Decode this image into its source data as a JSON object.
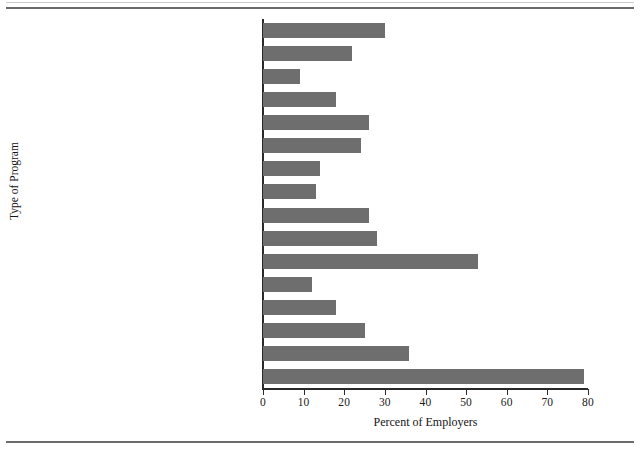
{
  "chart_data": {
    "type": "bar",
    "orientation": "horizontal",
    "title": "",
    "xlabel": "Percent of Employers",
    "ylabel": "Type of Program",
    "xlim": [
      0,
      80
    ],
    "xticks": [
      0,
      10,
      20,
      30,
      40,
      50,
      60,
      70,
      80
    ],
    "grid": false,
    "legend": null,
    "bar_color": "#6e6e6e",
    "axis_color": "#2a2a2a",
    "categories": [
      "Blood Pressure Screenings",
      "Cholesterol Screenings",
      "Cancer Screenings",
      "Health Risk Assessments",
      "Fitness Programs",
      "Nutrition or Cholesterol Education",
      "Weight Control Classes or Counseling",
      "Quit Smoking Classes or Counseling",
      "Stress Management Classes or Counseling",
      "Alcohol or Drug Abuse Program",
      "Back Injury Prevention",
      "Maternal or Prenatal Programs",
      "Balancing Work/Family Education",
      "HIV/AIDS Education",
      "Workplace Violence Prevention Programs",
      "Smoking Policy"
    ],
    "values": [
      30,
      22,
      9,
      18,
      26,
      24,
      14,
      13,
      26,
      28,
      53,
      12,
      18,
      25,
      36,
      79
    ]
  }
}
